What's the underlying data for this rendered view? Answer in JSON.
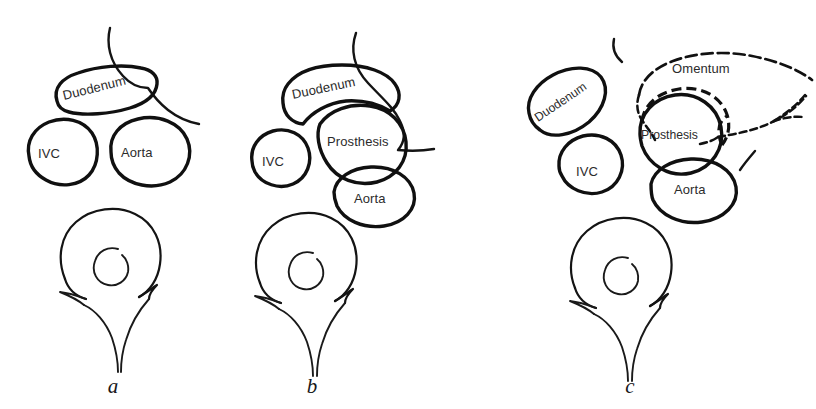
{
  "figure": {
    "background_color": "#ffffff",
    "ink_color": "#141414",
    "label_color": "#2b2b2b",
    "caption_color": "#17171a"
  },
  "panels": [
    {
      "id": "panel-a",
      "letter": "a",
      "structures": [
        {
          "name": "duodenum",
          "label": "Duodenum",
          "rotation_deg": -14
        },
        {
          "name": "ivc",
          "label": "IVC",
          "rotation_deg": 0
        },
        {
          "name": "aorta",
          "label": "Aorta",
          "rotation_deg": 0
        },
        {
          "name": "vertebra",
          "label": "",
          "rotation_deg": 0
        },
        {
          "name": "mesentery-line",
          "label": "",
          "rotation_deg": 0
        }
      ]
    },
    {
      "id": "panel-b",
      "letter": "b",
      "structures": [
        {
          "name": "duodenum",
          "label": "Duodenum",
          "rotation_deg": -12
        },
        {
          "name": "prosthesis",
          "label": "Prosthesis",
          "rotation_deg": 0
        },
        {
          "name": "ivc",
          "label": "IVC",
          "rotation_deg": 0
        },
        {
          "name": "aorta",
          "label": "Aorta",
          "rotation_deg": 0
        },
        {
          "name": "vertebra",
          "label": "",
          "rotation_deg": 0
        },
        {
          "name": "mesentery-line",
          "label": "",
          "rotation_deg": 0
        }
      ]
    },
    {
      "id": "panel-c",
      "letter": "c",
      "structures": [
        {
          "name": "omentum",
          "label": "Omentum",
          "rotation_deg": 0
        },
        {
          "name": "duodenum",
          "label": "Duodenum",
          "rotation_deg": -34
        },
        {
          "name": "prosthesis",
          "label": "Prosthesis",
          "rotation_deg": 0
        },
        {
          "name": "ivc",
          "label": "IVC",
          "rotation_deg": 0
        },
        {
          "name": "aorta",
          "label": "Aorta",
          "rotation_deg": 0
        },
        {
          "name": "vertebra",
          "label": "",
          "rotation_deg": 0
        }
      ]
    }
  ],
  "labels": {
    "duodenum": "Duodenum",
    "ivc": "IVC",
    "aorta": "Aorta",
    "prosthesis": "Prosthesis",
    "omentum": "Omentum"
  },
  "panel_letters": {
    "a": "a",
    "b": "b",
    "c": "c"
  }
}
